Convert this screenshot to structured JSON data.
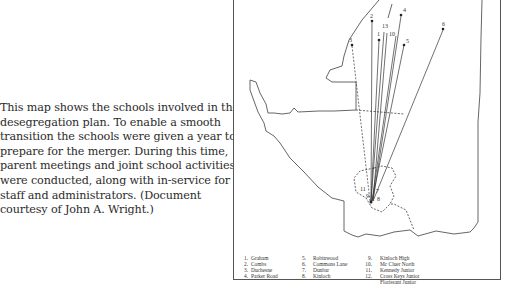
{
  "caption": {
    "text": "This map shows the schools involved in the desegregation plan. To enable a smooth transition the schools were given a year to prepare for the merger. During this time, parent meetings and joint school activities were conducted, along with in-service for staff and administrators. (Document courtesy of John A. Wright.)"
  },
  "map": {
    "map_labels": [
      "2",
      "13",
      "4",
      "1",
      "10",
      "5",
      "3",
      "6",
      "11",
      "9",
      "7",
      "8"
    ]
  },
  "legend": {
    "items": [
      {
        "num": "1.",
        "name": "Graham"
      },
      {
        "num": "2.",
        "name": "Combs"
      },
      {
        "num": "3.",
        "name": "Duchesne"
      },
      {
        "num": "4.",
        "name": "Parker Road"
      },
      {
        "num": "5.",
        "name": "Robinwood"
      },
      {
        "num": "6.",
        "name": "Commons Lane"
      },
      {
        "num": "7.",
        "name": "Dunbar"
      },
      {
        "num": "8.",
        "name": "Kinloch"
      },
      {
        "num": "9.",
        "name": "Kinloch High"
      },
      {
        "num": "10.",
        "name": "Mc Cluer North"
      },
      {
        "num": "11.",
        "name": "Kennedy Junior"
      },
      {
        "num": "12.",
        "name": "Cross Keys Junior"
      },
      {
        "num": "",
        "name": "Florissant Junior"
      }
    ]
  }
}
